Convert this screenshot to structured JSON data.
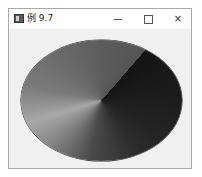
{
  "window": {
    "title": "例 9.7",
    "icon": "app-icon",
    "controls": {
      "minimize": "minimize-icon",
      "maximize": "maximize-icon",
      "close": "×"
    }
  },
  "canvas": {
    "shape": "ellipse",
    "fill": "conical-gradient",
    "colors": {
      "darkest": "#141414",
      "lightest": "#a8a8a8",
      "seam_light_side": "#555555"
    }
  }
}
